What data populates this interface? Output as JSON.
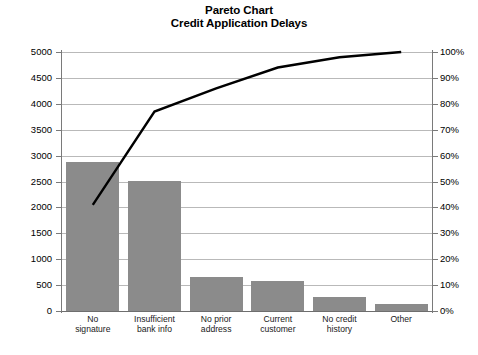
{
  "chart_data": {
    "type": "bar",
    "title": "Pareto Chart",
    "subtitle": "Credit Application Delays",
    "xlabel": "",
    "ylabel": "",
    "categories": [
      "No signature",
      "Insufficient bank info",
      "No prior address",
      "Current customer",
      "No credit history",
      "Other"
    ],
    "values": [
      2880,
      2500,
      650,
      580,
      270,
      135
    ],
    "cumulative_percent": [
      41,
      77,
      86,
      94,
      98,
      100
    ],
    "ylim": [
      0,
      5000
    ],
    "y2lim": [
      0,
      100
    ],
    "yticks": [
      0,
      500,
      1000,
      1500,
      2000,
      2500,
      3000,
      3500,
      4000,
      4500,
      5000
    ],
    "y2ticks": [
      "0%",
      "10%",
      "20%",
      "30%",
      "40%",
      "50%",
      "60%",
      "70%",
      "80%",
      "90%",
      "100%"
    ],
    "grid": true,
    "legend": "none",
    "bar_color": "#8b8b8b",
    "line_color": "#000000",
    "grid_color": "#b9b9b9",
    "axis_color": "#7a7a7a"
  },
  "axes": {
    "left_ticks": [
      "5000",
      "4500",
      "4000",
      "3500",
      "3000",
      "2500",
      "2000",
      "1500",
      "1000",
      "500",
      "0"
    ],
    "right_ticks": [
      "100%",
      "90%",
      "80%",
      "70%",
      "60%",
      "50%",
      "40%",
      "30%",
      "20%",
      "10%",
      "0%"
    ]
  },
  "categories_wrapped": [
    [
      "No",
      "signature"
    ],
    [
      "Insufficient",
      "bank info"
    ],
    [
      "No prior",
      "address"
    ],
    [
      "Current",
      "customer"
    ],
    [
      "No credit",
      "history"
    ],
    [
      "Other",
      ""
    ]
  ],
  "caption": ""
}
